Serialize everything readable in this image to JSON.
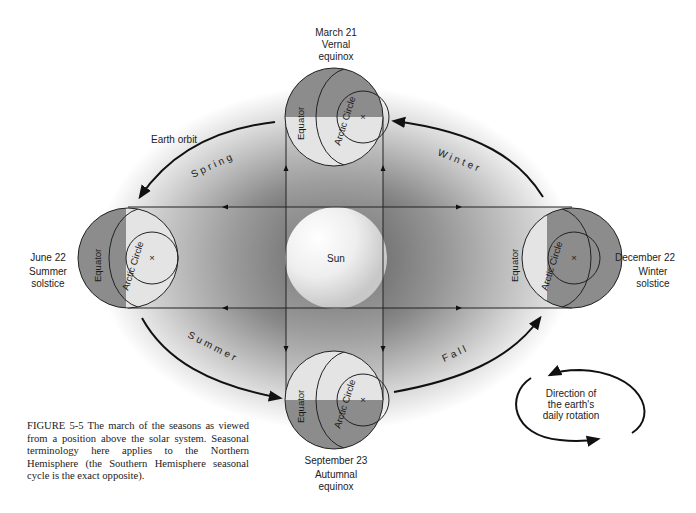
{
  "figure": {
    "caption": "FIGURE 5-5 The march of the seasons as viewed from a position above the solar system. Seasonal terminology here applies to the Northern Hemisphere (the Southern Hemisphere seasonal cycle is the exact opposite).",
    "center_label": "Sun",
    "orbit_label": "Earth orbit",
    "seasons": {
      "spring": "Spring",
      "winter": "Winter",
      "summer": "Summer",
      "fall": "Fall"
    },
    "positions": {
      "top": {
        "date": "March 21",
        "name_line1": "Vernal",
        "name_line2": "equinox"
      },
      "left": {
        "date": "June 22",
        "name_line1": "Summer",
        "name_line2": "solstice"
      },
      "right": {
        "date": "December 22",
        "name_line1": "Winter",
        "name_line2": "solstice"
      },
      "bottom": {
        "date": "September 23",
        "name_line1": "Autumnal",
        "name_line2": "equinox"
      }
    },
    "earth_labels": {
      "equator": "Equator",
      "arctic_circle": "Arctic Circle",
      "pole_marker": "×"
    },
    "rotation_note": {
      "line1": "Direction of",
      "line2": "the earth's",
      "line3": "daily rotation"
    },
    "colors": {
      "dark_hemisphere": "#8c8c8c",
      "light_hemisphere": "#e4e4e4",
      "line": "#1a1a1a"
    }
  }
}
